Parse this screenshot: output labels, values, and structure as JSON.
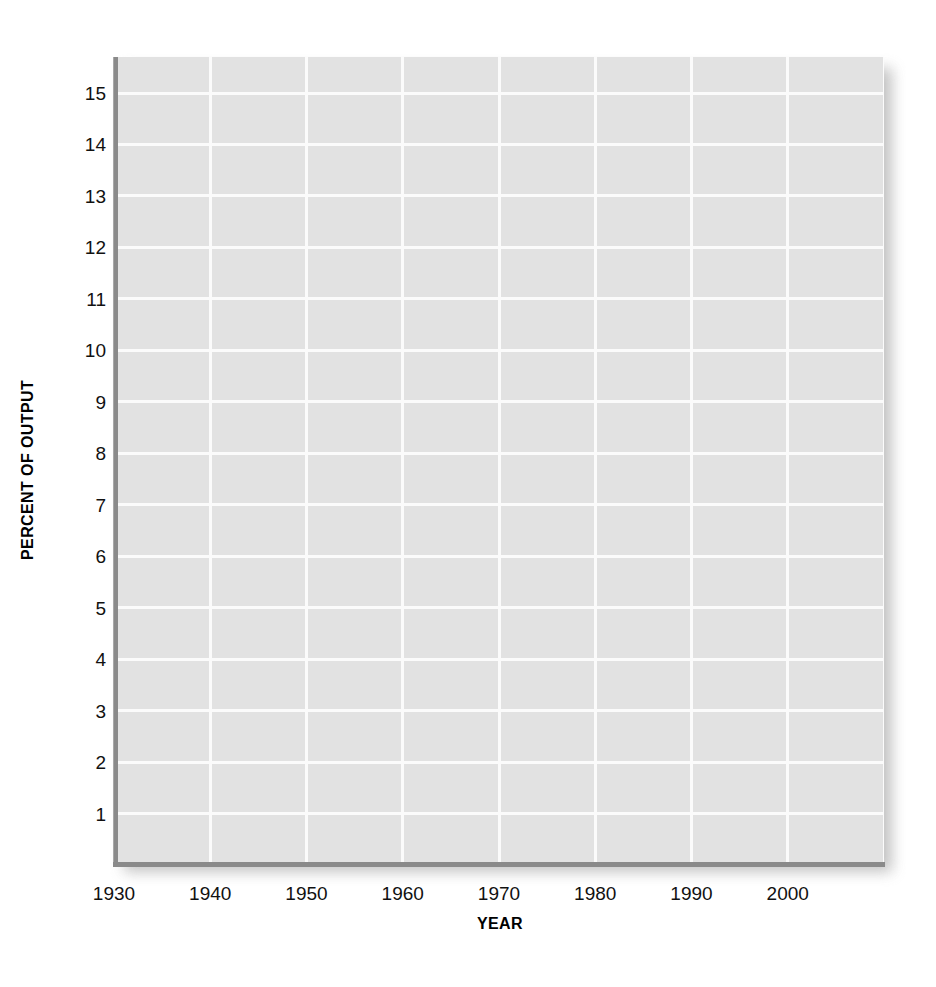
{
  "chart_data": {
    "type": "line",
    "title": "",
    "subtitle": "",
    "xlabel": "YEAR",
    "ylabel": "PERCENT OF OUTPUT",
    "xlim": [
      1930,
      2010
    ],
    "ylim": [
      0,
      15.7
    ],
    "xticks": [
      1930,
      1940,
      1950,
      1960,
      1970,
      1980,
      1990,
      2000
    ],
    "xtick_labels": [
      "1930",
      "1940",
      "1950",
      "1960",
      "1970",
      "1980",
      "1990",
      "2000"
    ],
    "yticks": [
      1,
      2,
      3,
      4,
      5,
      6,
      7,
      8,
      9,
      10,
      11,
      12,
      13,
      14,
      15
    ],
    "ytick_labels": [
      "1",
      "2",
      "3",
      "4",
      "5",
      "6",
      "7",
      "8",
      "9",
      "10",
      "11",
      "12",
      "13",
      "14",
      "15"
    ],
    "grid": true,
    "grid_color": "#fbfbfb",
    "plot_background": "#e2e2e2",
    "figure_background": "#ffffff",
    "axis_color": "#8a8a8a",
    "legend": null,
    "legend_position": "none",
    "series": [],
    "annotations": [],
    "note": "Empty plot grid: axes and gridlines drawn with no data series plotted."
  },
  "axes": {
    "y_title": "PERCENT OF OUTPUT",
    "x_title": "YEAR"
  }
}
